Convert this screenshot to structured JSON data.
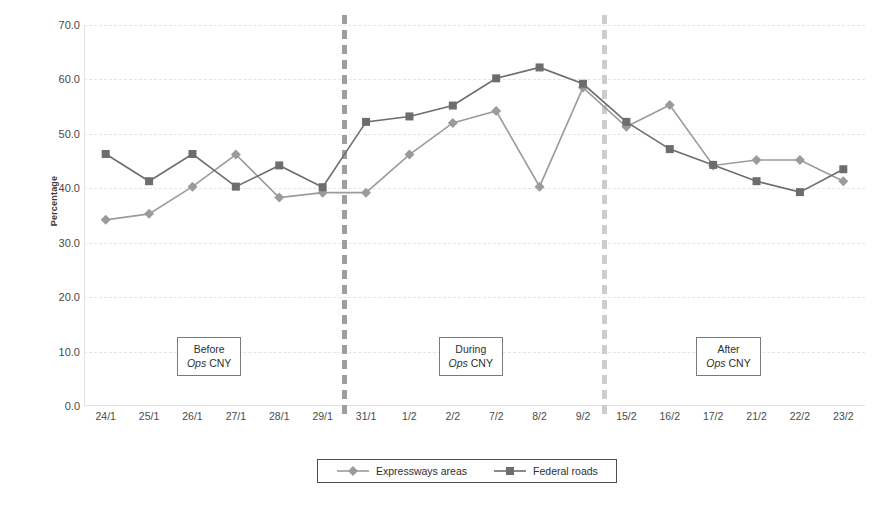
{
  "chart_data": {
    "type": "line",
    "title": "",
    "xlabel": "",
    "ylabel": "Percentage",
    "ylim": [
      0,
      70
    ],
    "ytick_step": 10,
    "grid": true,
    "legend_position": "bottom",
    "categories": [
      "24/1",
      "25/1",
      "26/1",
      "27/1",
      "28/1",
      "29/1",
      "31/1",
      "1/2",
      "2/2",
      "7/2",
      "8/2",
      "9/2",
      "15/2",
      "16/2",
      "17/2",
      "21/2",
      "22/2",
      "23/2"
    ],
    "ytick_labels": [
      "0.0",
      "10.0",
      "20.0",
      "30.0",
      "40.0",
      "50.0",
      "60.0",
      "70.0"
    ],
    "series": [
      {
        "name": "Expressways areas",
        "marker": "diamond",
        "color": "#9b9b9b",
        "values": [
          34.2,
          35.3,
          40.3,
          46.2,
          38.3,
          39.2,
          39.2,
          46.2,
          52.0,
          54.2,
          40.3,
          58.5,
          51.3,
          55.3,
          44.2,
          45.2,
          45.2,
          41.3
        ]
      },
      {
        "name": "Federal roads",
        "marker": "square",
        "color": "#6d6d6d",
        "values": [
          46.3,
          41.3,
          46.3,
          40.3,
          44.2,
          40.2,
          52.2,
          53.2,
          55.2,
          60.2,
          62.2,
          59.2,
          52.2,
          47.2,
          44.3,
          41.3,
          39.3,
          43.5
        ]
      }
    ],
    "annotations": [
      {
        "id": "before",
        "line1": "Before",
        "line2_em": "Ops",
        "line2_rest": "CNY",
        "x_pct": 16.0
      },
      {
        "id": "during",
        "line1": "During",
        "line2_em": "Ops",
        "line2_rest": "CNY",
        "x_pct": 49.5
      },
      {
        "id": "after",
        "line1": "After",
        "line2_em": "Ops",
        "line2_rest": "CNY",
        "x_pct": 82.5
      }
    ],
    "dividers": [
      {
        "id": "divider-before-during",
        "after_category": "29/1",
        "color": "#9e9e9e"
      },
      {
        "id": "divider-during-after",
        "after_category": "9/2",
        "color": "#cdcdcd"
      }
    ]
  }
}
